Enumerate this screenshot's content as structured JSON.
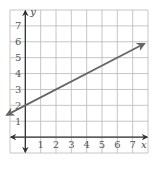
{
  "chart_data": {
    "type": "line",
    "title": "",
    "xlabel": "x",
    "ylabel": "y",
    "xlim": [
      -1,
      8
    ],
    "ylim": [
      -1,
      8
    ],
    "x_ticks": [
      1,
      2,
      3,
      4,
      5,
      6,
      7
    ],
    "y_ticks": [
      1,
      2,
      3,
      4,
      5,
      6,
      7
    ],
    "grid": true,
    "series": [
      {
        "name": "line",
        "equation": "y = 0.5x + 2",
        "slope": 0.5,
        "intercept": 2,
        "x": [
          -1,
          0,
          2,
          4,
          6,
          7.5
        ],
        "y": [
          1.5,
          2,
          3,
          4,
          5,
          5.75
        ],
        "arrows": "both",
        "color": "#666666"
      }
    ]
  },
  "colors": {
    "grid": "#b8b8b8",
    "axis": "#333333",
    "line": "#666666"
  }
}
